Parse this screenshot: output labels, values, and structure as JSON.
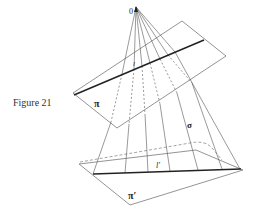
{
  "caption": "Figure 21",
  "labels": {
    "origin": "0",
    "plane_upper": "π",
    "plane_lower": "π′",
    "line_upper": "l",
    "line_lower": "l′",
    "sigma": "σ"
  },
  "colors": {
    "stroke": "#555555",
    "bold": "#222222",
    "background": "#ffffff"
  }
}
